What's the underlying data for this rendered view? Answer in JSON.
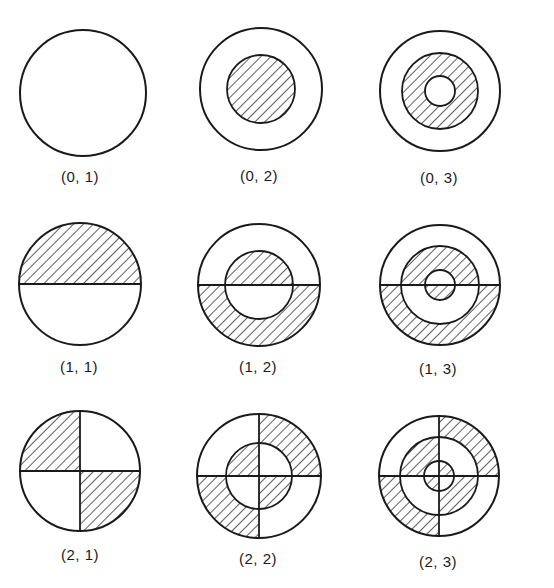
{
  "figure": {
    "colors": {
      "stroke": "#1a1a1a",
      "hatch": "#1a1a1a",
      "background": "#ffffff"
    },
    "modes": [
      {
        "id": "0-1",
        "label": "(0, 1)",
        "m": 0,
        "n": 1,
        "cx": 83,
        "cy": 93,
        "radii": [
          63
        ],
        "label_x": 80,
        "label_y": 168,
        "shaded": []
      },
      {
        "id": "0-2",
        "label": "(0, 2)",
        "m": 0,
        "n": 2,
        "cx": 261,
        "cy": 89,
        "radii": [
          61,
          34
        ],
        "label_x": 259,
        "label_y": 167,
        "shaded": [
          {
            "ring": 1,
            "sectors": "all"
          }
        ]
      },
      {
        "id": "0-3",
        "label": "(0, 3)",
        "m": 0,
        "n": 3,
        "cx": 440,
        "cy": 91,
        "radii": [
          60,
          38,
          15
        ],
        "label_x": 439,
        "label_y": 169,
        "shaded": [
          {
            "ring": 1,
            "sectors": "all"
          }
        ]
      },
      {
        "id": "1-1",
        "label": "(1, 1)",
        "m": 1,
        "n": 1,
        "cx": 80,
        "cy": 284,
        "radii": [
          61
        ],
        "label_x": 79,
        "label_y": 358,
        "shaded": [
          {
            "ring": 0,
            "sectors": "top"
          }
        ]
      },
      {
        "id": "1-2",
        "label": "(1, 2)",
        "m": 1,
        "n": 2,
        "cx": 259,
        "cy": 285,
        "radii": [
          61,
          34
        ],
        "label_x": 258,
        "label_y": 358,
        "shaded": [
          {
            "ring": 0,
            "sectors": "bottom"
          },
          {
            "ring": 1,
            "sectors": "top"
          }
        ]
      },
      {
        "id": "1-3",
        "label": "(1, 3)",
        "m": 1,
        "n": 3,
        "cx": 440,
        "cy": 285,
        "radii": [
          60,
          39,
          15
        ],
        "label_x": 438,
        "label_y": 360,
        "shaded": [
          {
            "ring": 0,
            "sectors": "bottom"
          },
          {
            "ring": 1,
            "sectors": "top"
          },
          {
            "ring": 2,
            "sectors": "bottom"
          }
        ]
      },
      {
        "id": "2-1",
        "label": "(2, 1)",
        "m": 2,
        "n": 1,
        "cx": 80,
        "cy": 471,
        "radii": [
          60
        ],
        "label_x": 80,
        "label_y": 546,
        "shaded": [
          {
            "ring": 0,
            "sectors": "tl-br"
          }
        ]
      },
      {
        "id": "2-2",
        "label": "(2, 2)",
        "m": 2,
        "n": 2,
        "cx": 259,
        "cy": 476,
        "radii": [
          62,
          33
        ],
        "label_x": 258,
        "label_y": 550,
        "shaded": [
          {
            "ring": 0,
            "sectors": "tr-bl"
          },
          {
            "ring": 1,
            "sectors": "tl-br"
          }
        ]
      },
      {
        "id": "2-3",
        "label": "(2, 3)",
        "m": 2,
        "n": 3,
        "cx": 439,
        "cy": 476,
        "radii": [
          60,
          39,
          15
        ],
        "label_x": 438,
        "label_y": 553,
        "shaded": [
          {
            "ring": 0,
            "sectors": "tr-bl"
          },
          {
            "ring": 1,
            "sectors": "tl-br"
          },
          {
            "ring": 2,
            "sectors": "tr-bl"
          }
        ]
      }
    ]
  }
}
